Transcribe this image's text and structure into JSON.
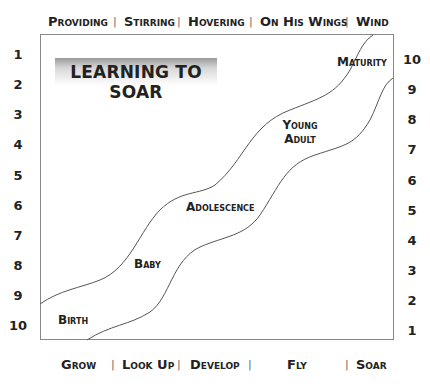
{
  "title": "LEARNING TO SOAR",
  "top_labels": [
    "Providing",
    "Stirring",
    "Hovering",
    "On His Wings",
    "Wind"
  ],
  "bottom_labels": [
    "Grow",
    "Look Up",
    "Develop",
    "Fly",
    "Soar"
  ],
  "separator": "|",
  "left_scale": [
    "1",
    "2",
    "3",
    "4",
    "5",
    "6",
    "7",
    "8",
    "9",
    "10"
  ],
  "right_scale": [
    "10",
    "9",
    "8",
    "7",
    "6",
    "5",
    "4",
    "3",
    "2",
    "1"
  ],
  "stages": {
    "birth": "Birth",
    "baby": "Baby",
    "adolescence": "Adolescence",
    "young_adult_line1": "Young",
    "young_adult_line2": "Adult",
    "maturity": "Maturity"
  },
  "colors": {
    "line": "#555555",
    "frame": "#888888",
    "text": "#222222"
  }
}
